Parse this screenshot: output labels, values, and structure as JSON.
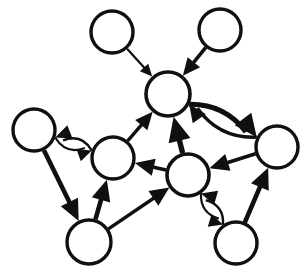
{
  "figure": {
    "background_color": "#ffffff",
    "ink_color": "#101010",
    "width": 307,
    "height": 271,
    "node_fill": "#ffffff",
    "node_count": 9,
    "edge_count": 16
  },
  "nodes": [
    {
      "id": "n1",
      "label": "",
      "name": "node-top-left",
      "cx": 112,
      "cy": 32,
      "r": 21,
      "stroke_width": 3.4
    },
    {
      "id": "n2",
      "label": "",
      "name": "node-top-right",
      "cx": 220,
      "cy": 30,
      "r": 21,
      "stroke_width": 3.4
    },
    {
      "id": "n3",
      "label": "",
      "name": "node-hub",
      "cx": 168,
      "cy": 94,
      "r": 22,
      "stroke_width": 3.6
    },
    {
      "id": "n4",
      "label": "",
      "name": "node-left",
      "cx": 34,
      "cy": 130,
      "r": 21,
      "stroke_width": 3.4
    },
    {
      "id": "n5",
      "label": "",
      "name": "node-left-middle",
      "cx": 113,
      "cy": 158,
      "r": 21,
      "stroke_width": 3.4
    },
    {
      "id": "n6",
      "label": "",
      "name": "node-center-bottom",
      "cx": 188,
      "cy": 175,
      "r": 21,
      "stroke_width": 3.6
    },
    {
      "id": "n7",
      "label": "",
      "name": "node-right",
      "cx": 277,
      "cy": 147,
      "r": 21,
      "stroke_width": 3.4
    },
    {
      "id": "n8",
      "label": "",
      "name": "node-bottom-left",
      "cx": 89,
      "cy": 242,
      "r": 22,
      "stroke_width": 3.4
    },
    {
      "id": "n9",
      "label": "",
      "name": "node-bottom-right",
      "cx": 236,
      "cy": 243,
      "r": 21,
      "stroke_width": 3.4
    }
  ],
  "edges": [
    {
      "id": "e1",
      "name": "edge-top-left-to-hub",
      "from": "n1",
      "to": "n3",
      "weight": "thin",
      "stroke_width": 2.2,
      "head_size": 7,
      "curve": 0
    },
    {
      "id": "e2",
      "name": "edge-top-right-to-hub",
      "from": "n2",
      "to": "n3",
      "weight": "medium",
      "stroke_width": 3.6,
      "head_size": 10,
      "curve": 0
    },
    {
      "id": "e3",
      "name": "edge-right-to-hub",
      "from": "n7",
      "to": "n3",
      "weight": "medium",
      "stroke_width": 3.4,
      "head_size": 10,
      "curve": -18
    },
    {
      "id": "e4",
      "name": "edge-hub-to-right",
      "from": "n3",
      "to": "n7",
      "weight": "heavy",
      "stroke_width": 5.2,
      "head_size": 13,
      "curve": -16
    },
    {
      "id": "e5",
      "name": "edge-left-middle-to-hub",
      "from": "n5",
      "to": "n3",
      "weight": "medium",
      "stroke_width": 3.4,
      "head_size": 10,
      "curve": 0
    },
    {
      "id": "e6",
      "name": "edge-center-bottom-to-hub",
      "from": "n6",
      "to": "n3",
      "weight": "heavy",
      "stroke_width": 5.4,
      "head_size": 14,
      "curve": 0
    },
    {
      "id": "e7",
      "name": "edge-left-to-left-middle",
      "from": "n4",
      "to": "n5",
      "weight": "thin",
      "stroke_width": 2.2,
      "head_size": 8,
      "curve": 13
    },
    {
      "id": "e8",
      "name": "edge-left-middle-to-left",
      "from": "n5",
      "to": "n4",
      "weight": "thin",
      "stroke_width": 2.4,
      "head_size": 9,
      "curve": 13
    },
    {
      "id": "e9",
      "name": "edge-left-to-bottom-left",
      "from": "n4",
      "to": "n8",
      "weight": "heavy",
      "stroke_width": 4.6,
      "head_size": 12,
      "curve": 0
    },
    {
      "id": "e10",
      "name": "edge-bottom-left-to-left-middle",
      "from": "n8",
      "to": "n5",
      "weight": "heavy",
      "stroke_width": 4.6,
      "head_size": 12,
      "curve": 0
    },
    {
      "id": "e11",
      "name": "edge-bottom-left-to-center-bottom",
      "from": "n8",
      "to": "n6",
      "weight": "medium",
      "stroke_width": 3.4,
      "head_size": 11,
      "curve": 0
    },
    {
      "id": "e12",
      "name": "edge-center-bottom-to-left-middle",
      "from": "n6",
      "to": "n5",
      "weight": "medium",
      "stroke_width": 3.6,
      "head_size": 11,
      "curve": 0
    },
    {
      "id": "e13",
      "name": "edge-right-to-center-bottom",
      "from": "n7",
      "to": "n6",
      "weight": "medium",
      "stroke_width": 3.6,
      "head_size": 11,
      "curve": 0
    },
    {
      "id": "e14",
      "name": "edge-bottom-right-to-right",
      "from": "n9",
      "to": "n7",
      "weight": "heavy",
      "stroke_width": 4.6,
      "head_size": 12,
      "curve": 0
    },
    {
      "id": "e15",
      "name": "edge-center-bottom-to-bottom-right",
      "from": "n6",
      "to": "n9",
      "weight": "thin",
      "stroke_width": 2.2,
      "head_size": 8,
      "curve": 12
    },
    {
      "id": "e16",
      "name": "edge-bottom-right-to-center-bottom",
      "from": "n9",
      "to": "n6",
      "weight": "thin",
      "stroke_width": 2.4,
      "head_size": 9,
      "curve": 12
    }
  ]
}
